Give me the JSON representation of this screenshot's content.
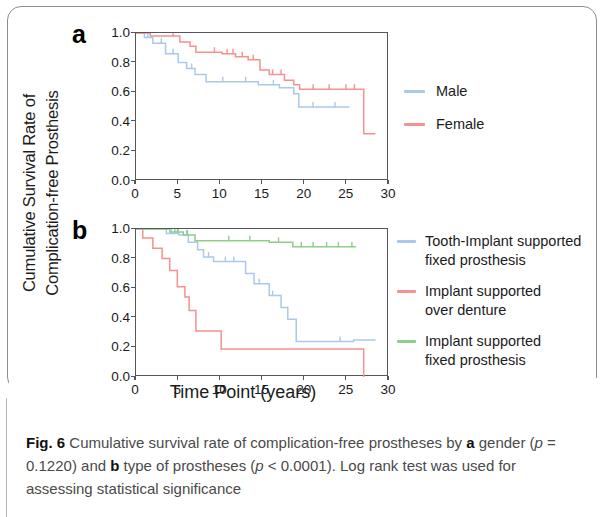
{
  "figure": {
    "label": "Fig. 6",
    "caption_parts": {
      "p1": "Cumulative survival rate of complication-free prostheses by ",
      "bold_a": "a",
      "p2": " gender (",
      "italic_p1": "p",
      "p3": " = 0.1220) and ",
      "bold_b": "b",
      "p4": " type of prostheses (",
      "italic_p2": "p",
      "p5": " < 0.0001). Log rank test was used for assessing statistical significance"
    },
    "caption_full": "Fig. 6 Cumulative survival rate of complication-free prostheses by a gender (p = 0.1220) and b type of prostheses (p < 0.0001). Log rank test was used for assessing statistical significance"
  },
  "axes": {
    "ylabel_line1": "Cumulative Survival Rate of",
    "ylabel_line2": "Complication-free Prosthesis",
    "xlabel": "Time Point (years)"
  },
  "panels": {
    "a": {
      "letter": "a"
    },
    "b": {
      "letter": "b"
    }
  },
  "colors": {
    "blue": "#a9c9ea",
    "red": "#f5918f",
    "green": "#8ece8a",
    "axis": "#56555a",
    "text": "#1b1b1b",
    "caption": "#4a4a4a"
  },
  "chart_data": [
    {
      "type": "line",
      "panel": "a",
      "title": "",
      "xlabel": "Time Point (years)",
      "ylabel": "Cumulative Survival Rate of Complication-free Prosthesis",
      "xlim": [
        0,
        30
      ],
      "ylim": [
        0.0,
        1.0
      ],
      "xticks": [
        0,
        5,
        10,
        15,
        20,
        25,
        30
      ],
      "yticks": [
        0.0,
        0.2,
        0.4,
        0.6,
        0.8,
        1.0
      ],
      "grid": false,
      "legend_position": "right",
      "curve_style": "kaplan-meier step",
      "series": [
        {
          "name": "Male",
          "color": "#a9c9ea",
          "points": [
            [
              0.0,
              1.0
            ],
            [
              1.0,
              1.0
            ],
            [
              1.0,
              0.97
            ],
            [
              2.0,
              0.97
            ],
            [
              2.0,
              0.93
            ],
            [
              3.5,
              0.93
            ],
            [
              3.5,
              0.86
            ],
            [
              5.0,
              0.86
            ],
            [
              5.0,
              0.8
            ],
            [
              6.0,
              0.8
            ],
            [
              6.0,
              0.76
            ],
            [
              7.0,
              0.76
            ],
            [
              7.0,
              0.72
            ],
            [
              8.3,
              0.72
            ],
            [
              8.3,
              0.67
            ],
            [
              14.5,
              0.67
            ],
            [
              14.5,
              0.65
            ],
            [
              17.0,
              0.65
            ],
            [
              17.0,
              0.63
            ],
            [
              18.7,
              0.63
            ],
            [
              18.7,
              0.59
            ],
            [
              19.3,
              0.59
            ],
            [
              19.3,
              0.5
            ],
            [
              25.3,
              0.5
            ]
          ],
          "censor_marks": [
            0.6,
            1.4,
            3.0,
            4.4,
            6.6,
            10.3,
            13.0,
            16.3,
            21.0,
            23.6
          ]
        },
        {
          "name": "Female",
          "color": "#f5918f",
          "points": [
            [
              0.0,
              1.0
            ],
            [
              1.7,
              1.0
            ],
            [
              1.7,
              0.98
            ],
            [
              5.2,
              0.98
            ],
            [
              5.2,
              0.94
            ],
            [
              6.4,
              0.94
            ],
            [
              6.4,
              0.91
            ],
            [
              7.1,
              0.91
            ],
            [
              7.1,
              0.87
            ],
            [
              10.2,
              0.87
            ],
            [
              10.2,
              0.86
            ],
            [
              11.8,
              0.86
            ],
            [
              11.8,
              0.84
            ],
            [
              13.3,
              0.84
            ],
            [
              13.3,
              0.82
            ],
            [
              14.7,
              0.82
            ],
            [
              14.7,
              0.75
            ],
            [
              15.8,
              0.75
            ],
            [
              15.8,
              0.72
            ],
            [
              17.6,
              0.72
            ],
            [
              17.6,
              0.68
            ],
            [
              18.7,
              0.68
            ],
            [
              18.7,
              0.65
            ],
            [
              19.4,
              0.65
            ],
            [
              19.4,
              0.62
            ],
            [
              27.0,
              0.62
            ],
            [
              27.0,
              0.32
            ],
            [
              28.4,
              0.32
            ]
          ],
          "censor_marks": [
            0.8,
            4.4,
            9.3,
            10.8,
            11.5,
            12.6,
            13.9,
            16.2,
            17.2,
            21.0,
            22.9,
            24.9,
            25.9
          ]
        }
      ]
    },
    {
      "type": "line",
      "panel": "b",
      "title": "",
      "xlabel": "Time Point (years)",
      "ylabel": "Cumulative Survival Rate of Complication-free Prosthesis",
      "xlim": [
        0,
        30
      ],
      "ylim": [
        0.0,
        1.0
      ],
      "xticks": [
        0,
        5,
        10,
        15,
        20,
        25,
        30
      ],
      "yticks": [
        0.0,
        0.2,
        0.4,
        0.6,
        0.8,
        1.0
      ],
      "grid": false,
      "legend_position": "right",
      "curve_style": "kaplan-meier step",
      "series": [
        {
          "name": "Tooth-Implant supported fixed prosthesis",
          "color": "#a9c9ea",
          "points": [
            [
              0.0,
              1.0
            ],
            [
              3.6,
              1.0
            ],
            [
              3.6,
              0.97
            ],
            [
              5.1,
              0.97
            ],
            [
              5.1,
              0.96
            ],
            [
              6.2,
              0.96
            ],
            [
              6.2,
              0.91
            ],
            [
              7.3,
              0.91
            ],
            [
              7.3,
              0.86
            ],
            [
              8.0,
              0.86
            ],
            [
              8.0,
              0.81
            ],
            [
              9.2,
              0.81
            ],
            [
              9.2,
              0.78
            ],
            [
              13.0,
              0.78
            ],
            [
              13.0,
              0.7
            ],
            [
              14.0,
              0.7
            ],
            [
              14.0,
              0.63
            ],
            [
              15.8,
              0.63
            ],
            [
              15.8,
              0.55
            ],
            [
              17.2,
              0.55
            ],
            [
              17.2,
              0.47
            ],
            [
              18.0,
              0.47
            ],
            [
              18.0,
              0.39
            ],
            [
              19.0,
              0.39
            ],
            [
              19.0,
              0.24
            ],
            [
              25.8,
              0.24
            ],
            [
              25.8,
              0.25
            ],
            [
              28.4,
              0.25
            ]
          ],
          "censor_marks": [
            0.7,
            1.9,
            4.2,
            4.9,
            6.0,
            8.6,
            10.6,
            11.6,
            14.6,
            16.2,
            24.2
          ]
        },
        {
          "name": "Implant supported over denture",
          "color": "#f5918f",
          "points": [
            [
              0.0,
              1.0
            ],
            [
              0.8,
              1.0
            ],
            [
              0.8,
              0.94
            ],
            [
              2.0,
              0.94
            ],
            [
              2.0,
              0.87
            ],
            [
              3.1,
              0.87
            ],
            [
              3.1,
              0.8
            ],
            [
              4.0,
              0.8
            ],
            [
              4.0,
              0.72
            ],
            [
              4.9,
              0.72
            ],
            [
              4.9,
              0.61
            ],
            [
              5.8,
              0.61
            ],
            [
              5.8,
              0.54
            ],
            [
              6.3,
              0.54
            ],
            [
              6.3,
              0.45
            ],
            [
              7.1,
              0.45
            ],
            [
              7.1,
              0.31
            ],
            [
              10.1,
              0.31
            ],
            [
              10.1,
              0.19
            ],
            [
              27.0,
              0.19
            ],
            [
              27.0,
              0.0
            ]
          ],
          "censor_marks": []
        },
        {
          "name": "Implant supported fixed prosthesis",
          "color": "#8ece8a",
          "points": [
            [
              0.0,
              1.0
            ],
            [
              4.0,
              1.0
            ],
            [
              4.0,
              0.98
            ],
            [
              5.6,
              0.98
            ],
            [
              5.6,
              0.96
            ],
            [
              7.0,
              0.96
            ],
            [
              7.0,
              0.92
            ],
            [
              15.8,
              0.92
            ],
            [
              15.8,
              0.91
            ],
            [
              18.6,
              0.91
            ],
            [
              18.6,
              0.88
            ],
            [
              26.1,
              0.88
            ]
          ],
          "censor_marks": [
            4.6,
            5.0,
            6.1,
            11.0,
            13.5,
            16.9,
            19.6,
            21.0,
            22.6,
            24.0,
            25.6
          ]
        }
      ]
    }
  ],
  "legend_a": {
    "items": [
      {
        "label": "Male",
        "label2": "",
        "color": "#a9c9ea"
      },
      {
        "label": "Female",
        "label2": "",
        "color": "#f5918f"
      }
    ]
  },
  "legend_b": {
    "items": [
      {
        "label": "Tooth-Implant supported",
        "label2": "fixed prosthesis",
        "color": "#a9c9ea"
      },
      {
        "label": "Implant supported",
        "label2": "over denture",
        "color": "#f5918f"
      },
      {
        "label": "Implant supported",
        "label2": "fixed prosthesis",
        "color": "#8ece8a"
      }
    ]
  }
}
